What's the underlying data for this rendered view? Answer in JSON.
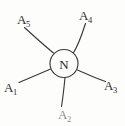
{
  "figure": {
    "type": "hand-drawn node-link diagram",
    "center_node": {
      "label": "N",
      "shape": "circle"
    },
    "outer_nodes": [
      {
        "id": "a1",
        "base": "A",
        "subscript": "1",
        "label": "A1",
        "position": "lower-left"
      },
      {
        "id": "a2",
        "base": "A",
        "subscript": "2",
        "label": "A2",
        "position": "bottom"
      },
      {
        "id": "a3",
        "base": "A",
        "subscript": "3",
        "label": "A3",
        "position": "right"
      },
      {
        "id": "a4",
        "base": "A",
        "subscript": "4",
        "label": "A4",
        "position": "upper-right"
      },
      {
        "id": "a5",
        "base": "A",
        "subscript": "5",
        "label": "A5",
        "position": "upper-left"
      }
    ],
    "edges": [
      {
        "from": "N",
        "to": "a1"
      },
      {
        "from": "N",
        "to": "a2"
      },
      {
        "from": "N",
        "to": "a3"
      },
      {
        "from": "N",
        "to": "a4"
      },
      {
        "from": "N",
        "to": "a5"
      }
    ],
    "colors": {
      "background": "#fdfdfc",
      "ink": "#3a3a3a",
      "text": "#2e2e2e"
    }
  }
}
